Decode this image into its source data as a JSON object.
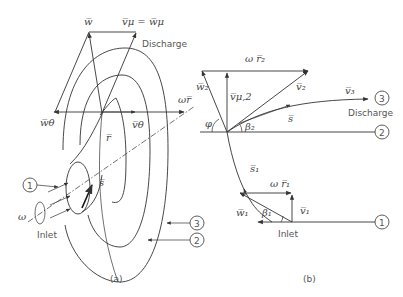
{
  "panel_a": {
    "caption": "(a)",
    "labels": {
      "w": "w̅",
      "v_mu_eq_w_mu": "v̅μ = w̅μ",
      "discharge": "Discharge",
      "w_theta": "w̅θ",
      "v_theta": "v̅θ",
      "omega_r": "ωr̅",
      "r": "r̅",
      "s": "s̅",
      "omega": "ω",
      "inlet": "Inlet"
    },
    "markers": [
      "1",
      "2",
      "3"
    ]
  },
  "panel_b": {
    "caption": "(b)",
    "labels": {
      "omega_r2": "ω r̅₂",
      "w2": "w̅₂",
      "v_mu2": "v̅μ,2",
      "v2": "v̅₂",
      "v3": "v̅₃",
      "s": "s̅",
      "phi": "φ",
      "beta2": "β₂",
      "discharge": "Discharge",
      "s1": "s̅₁",
      "omega_r1": "ω r̅₁",
      "w1": "w̅₁",
      "beta1": "β₁",
      "v1": "v̅₁",
      "inlet": "Inlet"
    },
    "markers": [
      "3",
      "2",
      "1"
    ]
  }
}
